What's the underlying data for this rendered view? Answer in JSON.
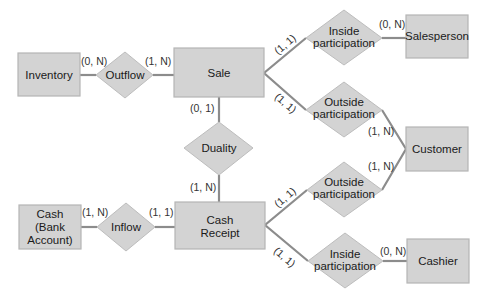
{
  "diagram": {
    "type": "entity-relationship",
    "colors": {
      "shape_fill": "#d3d3d3",
      "shape_border": "#b5b5b5",
      "connector": "#8c8c8c",
      "text": "#1a1a1a"
    },
    "entities": {
      "inventory": {
        "label": [
          "Inventory"
        ]
      },
      "sale": {
        "label": [
          "Sale"
        ]
      },
      "salesperson": {
        "label": [
          "Salesperson"
        ]
      },
      "customer": {
        "label": [
          "Customer"
        ]
      },
      "cash": {
        "label": [
          "Cash",
          "(Bank",
          "Account)"
        ]
      },
      "cash_receipt": {
        "label": [
          "Cash",
          "Receipt"
        ]
      },
      "cashier": {
        "label": [
          "Cashier"
        ]
      }
    },
    "relationships": {
      "outflow": {
        "label": [
          "Outflow"
        ]
      },
      "duality": {
        "label": [
          "Duality"
        ]
      },
      "inflow": {
        "label": [
          "Inflow"
        ]
      },
      "sale_inside": {
        "label": [
          "Inside",
          "participation"
        ]
      },
      "sale_outside": {
        "label": [
          "Outside",
          "participation"
        ]
      },
      "receipt_outside": {
        "label": [
          "Outside",
          "participation"
        ]
      },
      "receipt_inside": {
        "label": [
          "Inside",
          "participation"
        ]
      }
    },
    "cardinalities": {
      "inventory_outflow": "(0, N)",
      "outflow_sale": "(1, N)",
      "sale_duality": "(0, 1)",
      "duality_receipt": "(1, N)",
      "cash_inflow": "(1, N)",
      "inflow_receipt": "(1, 1)",
      "sale_inside": "(1, 1)",
      "inside_salesperson": "(0, N)",
      "sale_outside": "(1, 1)",
      "outside_customer_top": "(1, N)",
      "receipt_outside": "(1, 1)",
      "outside_customer_bottom": "(1, N)",
      "receipt_inside": "(1, 1)",
      "inside_cashier": "(0, N)"
    }
  }
}
